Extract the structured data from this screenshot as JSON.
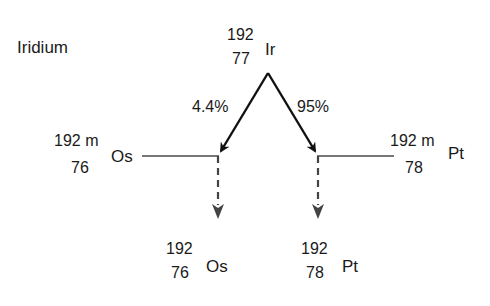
{
  "title": "Iridium",
  "parent": {
    "mass": "192",
    "atomic_number": "77",
    "symbol": "Ir"
  },
  "branches": [
    {
      "percent": "4.4%",
      "direction": "left"
    },
    {
      "percent": "95%",
      "direction": "right"
    }
  ],
  "intermediates": [
    {
      "mass": "192 m",
      "atomic_number": "76",
      "symbol": "Os"
    },
    {
      "mass": "192 m",
      "atomic_number": "78",
      "symbol": "Pt"
    }
  ],
  "products": [
    {
      "mass": "192",
      "atomic_number": "76",
      "symbol": "Os"
    },
    {
      "mass": "192",
      "atomic_number": "78",
      "symbol": "Pt"
    }
  ],
  "colors": {
    "arrow": "#111111",
    "level_line": "#777777",
    "dashed": "#444444",
    "text": "#1a1a1a"
  }
}
